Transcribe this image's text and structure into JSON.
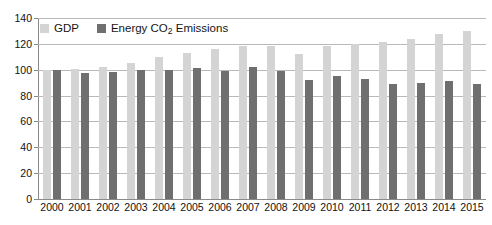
{
  "chart_data": {
    "type": "bar",
    "title": "",
    "subtitle": "",
    "xlabel": "",
    "ylabel": "",
    "categories": [
      "2000",
      "2001",
      "2002",
      "2003",
      "2004",
      "2005",
      "2006",
      "2007",
      "2008",
      "2009",
      "2010",
      "2011",
      "2012",
      "2013",
      "2014",
      "2015"
    ],
    "series": [
      {
        "name": "GDP",
        "color": "#d4d4d4",
        "values": [
          100,
          100.5,
          102,
          105.5,
          110,
          113,
          116,
          118.5,
          118,
          112.5,
          118,
          120,
          121.5,
          124,
          127.5,
          130
        ]
      },
      {
        "name": "Energy CO2 Emissions",
        "color": "#6f6f6f",
        "values": [
          100,
          97.5,
          98.5,
          99.5,
          99.5,
          101.5,
          99,
          102,
          99,
          92,
          95,
          93,
          89,
          90,
          91.5,
          89
        ]
      }
    ],
    "ylim": [
      0,
      140
    ],
    "yticks": [
      0,
      20,
      40,
      60,
      80,
      100,
      120,
      140
    ],
    "ytick_labels": [
      "0",
      "20",
      "40",
      "60",
      "80",
      "100",
      "120",
      "140"
    ],
    "grid": true,
    "grid_axis": "y",
    "legend_position": "top-left"
  },
  "legend": {
    "entries": [
      {
        "label": "GDP",
        "swatch": "gdp-swatch"
      },
      {
        "label_pre": "Energy CO",
        "label_sub": "2",
        "label_post": " Emissions",
        "swatch": "co2-swatch"
      }
    ]
  },
  "colors": {
    "gdp": "#d4d4d4",
    "co2": "#6f6f6f",
    "gridline": "#b9b9b9",
    "axis": "#8a8a8a",
    "text": "#111111",
    "background": "#ffffff"
  }
}
